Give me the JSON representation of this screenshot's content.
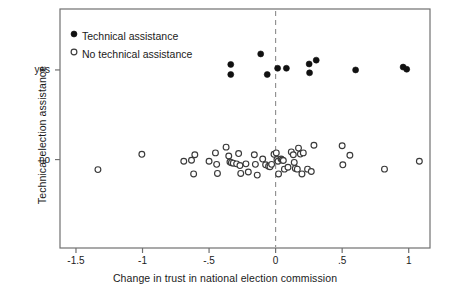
{
  "chart_data": {
    "type": "scatter",
    "title": "",
    "xlabel": "Change in trust in national election commission",
    "ylabel": "Technical election assistance",
    "xlim": [
      -1.62,
      1.16
    ],
    "ylim": [
      0,
      1
    ],
    "grid": false,
    "legend_position": "top-left",
    "xticks": [
      -1.5,
      -1,
      -0.5,
      0,
      0.5,
      1
    ],
    "xtick_labels": [
      "-1.5",
      "-1",
      "-.5",
      "0",
      ".5",
      "1"
    ],
    "yticks": [
      0.37,
      0.745
    ],
    "ytick_labels": [
      "no",
      "yes"
    ],
    "reference_line": {
      "orientation": "vertical",
      "x": 0,
      "style": "dashed",
      "color": "#8c8c8c"
    },
    "marker_colors": {
      "filled": "#111111",
      "open_stroke": "#3a3a3a",
      "open_fill": "#ffffff",
      "axis": "#707070"
    },
    "series": [
      {
        "name": "Technical assistance",
        "marker": "filled-circle",
        "y_category": "yes",
        "points": [
          {
            "x": -0.337,
            "y": 0.768
          },
          {
            "x": -0.337,
            "y": 0.726
          },
          {
            "x": -0.112,
            "y": 0.812
          },
          {
            "x": -0.063,
            "y": 0.726
          },
          {
            "x": 0.015,
            "y": 0.752
          },
          {
            "x": 0.081,
            "y": 0.752
          },
          {
            "x": 0.252,
            "y": 0.77
          },
          {
            "x": 0.255,
            "y": 0.733
          },
          {
            "x": 0.305,
            "y": 0.786
          },
          {
            "x": 0.601,
            "y": 0.745
          },
          {
            "x": 0.958,
            "y": 0.757
          },
          {
            "x": 0.985,
            "y": 0.748
          }
        ]
      },
      {
        "name": "No technical assistance",
        "marker": "open-circle",
        "y_category": "no",
        "points": [
          {
            "x": -1.335,
            "y": 0.328
          },
          {
            "x": -1.005,
            "y": 0.392
          },
          {
            "x": -0.69,
            "y": 0.363
          },
          {
            "x": -0.632,
            "y": 0.367
          },
          {
            "x": -0.607,
            "y": 0.39
          },
          {
            "x": -0.616,
            "y": 0.31
          },
          {
            "x": -0.5,
            "y": 0.363
          },
          {
            "x": -0.452,
            "y": 0.398
          },
          {
            "x": -0.443,
            "y": 0.35
          },
          {
            "x": -0.437,
            "y": 0.312
          },
          {
            "x": -0.372,
            "y": 0.422
          },
          {
            "x": -0.352,
            "y": 0.385
          },
          {
            "x": -0.343,
            "y": 0.36
          },
          {
            "x": -0.332,
            "y": 0.357
          },
          {
            "x": -0.318,
            "y": 0.355
          },
          {
            "x": -0.293,
            "y": 0.352
          },
          {
            "x": -0.278,
            "y": 0.395
          },
          {
            "x": -0.268,
            "y": 0.345
          },
          {
            "x": -0.262,
            "y": 0.312
          },
          {
            "x": -0.223,
            "y": 0.352
          },
          {
            "x": -0.205,
            "y": 0.318
          },
          {
            "x": -0.16,
            "y": 0.39
          },
          {
            "x": -0.152,
            "y": 0.35
          },
          {
            "x": -0.138,
            "y": 0.305
          },
          {
            "x": -0.097,
            "y": 0.372
          },
          {
            "x": -0.075,
            "y": 0.348
          },
          {
            "x": -0.053,
            "y": 0.342
          },
          {
            "x": -0.042,
            "y": 0.34
          },
          {
            "x": -0.03,
            "y": 0.35
          },
          {
            "x": -0.012,
            "y": 0.392
          },
          {
            "x": 0.005,
            "y": 0.398
          },
          {
            "x": 0.01,
            "y": 0.37
          },
          {
            "x": 0.018,
            "y": 0.363
          },
          {
            "x": 0.022,
            "y": 0.31
          },
          {
            "x": 0.041,
            "y": 0.372
          },
          {
            "x": 0.049,
            "y": 0.368
          },
          {
            "x": 0.058,
            "y": 0.366
          },
          {
            "x": 0.066,
            "y": 0.33
          },
          {
            "x": 0.093,
            "y": 0.338
          },
          {
            "x": 0.118,
            "y": 0.402
          },
          {
            "x": 0.133,
            "y": 0.39
          },
          {
            "x": 0.14,
            "y": 0.358
          },
          {
            "x": 0.148,
            "y": 0.333
          },
          {
            "x": 0.163,
            "y": 0.33
          },
          {
            "x": 0.172,
            "y": 0.418
          },
          {
            "x": 0.186,
            "y": 0.393
          },
          {
            "x": 0.198,
            "y": 0.31
          },
          {
            "x": 0.208,
            "y": 0.398
          },
          {
            "x": 0.24,
            "y": 0.33
          },
          {
            "x": 0.268,
            "y": 0.32
          },
          {
            "x": 0.288,
            "y": 0.43
          },
          {
            "x": 0.5,
            "y": 0.428
          },
          {
            "x": 0.505,
            "y": 0.348
          },
          {
            "x": 0.558,
            "y": 0.388
          },
          {
            "x": 0.818,
            "y": 0.33
          },
          {
            "x": 1.08,
            "y": 0.363
          }
        ]
      }
    ]
  },
  "legend": {
    "entries": [
      {
        "label": "Technical assistance",
        "marker": "filled-circle"
      },
      {
        "label": "No technical assistance",
        "marker": "open-circle"
      }
    ]
  }
}
